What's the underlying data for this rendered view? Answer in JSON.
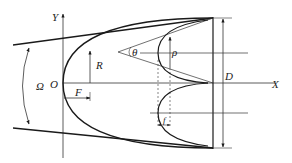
{
  "diagram": {
    "type": "paraboloid reflector geometry with dimension annotations",
    "labels": {
      "y_axis": "Y",
      "x_axis": "X",
      "origin": "O",
      "aperture_angle": "Ω",
      "radius": "R",
      "focal_length": "F",
      "diameter": "D",
      "half_angle": "θ",
      "rho": "ρ",
      "small_offset": "f"
    },
    "colors": {
      "line": "#1a1a1a",
      "thin_line": "#333333",
      "background": "#ffffff"
    }
  }
}
